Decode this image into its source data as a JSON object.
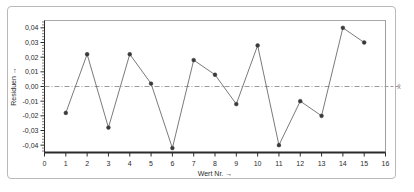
{
  "chart_data": {
    "type": "line",
    "title": "",
    "subtitle": "",
    "xlabel": "Wert Nr. →",
    "ylabel": "Residuen →",
    "xlim": [
      0,
      16
    ],
    "ylim": [
      -0.045,
      0.045
    ],
    "xticks": [
      0,
      1,
      2,
      3,
      4,
      5,
      6,
      7,
      8,
      9,
      10,
      11,
      12,
      13,
      14,
      15,
      16
    ],
    "xtick_labels": [
      "0",
      "1",
      "2",
      "3",
      "4",
      "5",
      "6",
      "7",
      "8",
      "9",
      "10",
      "11",
      "12",
      "13",
      "14",
      "15",
      "16"
    ],
    "yticks": [
      0.04,
      0.03,
      0.02,
      0.01,
      0.0,
      -0.01,
      -0.02,
      -0.03,
      -0.04
    ],
    "ytick_labels": [
      "0,04",
      "0,03",
      "0,02",
      "0,01",
      "0,00",
      "-0,01",
      "-0,02",
      "-0,03",
      "-0,04"
    ],
    "grid": false,
    "legend": "none",
    "x": [
      1,
      2,
      3,
      4,
      5,
      6,
      7,
      8,
      9,
      10,
      11,
      12,
      13,
      14,
      15
    ],
    "values": [
      -0.018,
      0.022,
      -0.028,
      0.022,
      0.002,
      -0.042,
      0.018,
      0.008,
      -0.012,
      0.028,
      -0.04,
      -0.01,
      -0.02,
      0.04,
      0.03
    ],
    "series": [
      {
        "name": "Residuen",
        "values": [
          -0.018,
          0.022,
          -0.028,
          0.022,
          0.002,
          -0.042,
          0.018,
          0.008,
          -0.012,
          0.028,
          -0.04,
          -0.01,
          -0.02,
          0.04,
          0.03
        ],
        "marker": "filled-circle",
        "color": "#3a3a3a"
      }
    ],
    "reference_lines": [
      {
        "name": "mean-line",
        "orientation": "horizontal",
        "value": 0.0,
        "label": "x̄",
        "style": "dash-dot",
        "color": "#9a9a9a"
      }
    ]
  },
  "axes": {
    "y_title": "Residuen →",
    "x_title": "Wert Nr. →",
    "mean_marker_label": "x̄"
  },
  "colors": {
    "line": "#6b6b6b",
    "marker": "#3a3a3a",
    "axis": "#2b2b2b",
    "frame": "#b9b9b9",
    "reference": "#9a9a9a",
    "background": "#ffffff"
  }
}
